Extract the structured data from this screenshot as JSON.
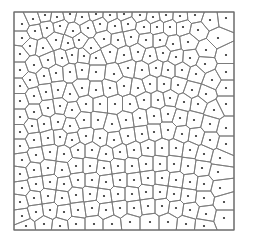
{
  "diagram": {
    "type": "voronoi",
    "frame": {
      "x": 14,
      "y": 12,
      "width": 220,
      "height": 218
    },
    "colors": {
      "background": "#ffffff",
      "edge": "#7a7a7a",
      "site": "#2b2b2b",
      "frame": "#6e6e6e"
    },
    "sites": [
      [
        22,
        24
      ],
      [
        33,
        19
      ],
      [
        45,
        15
      ],
      [
        57,
        17
      ],
      [
        70,
        14
      ],
      [
        82,
        17
      ],
      [
        96,
        14
      ],
      [
        110,
        15
      ],
      [
        124,
        14
      ],
      [
        140,
        15
      ],
      [
        153,
        17
      ],
      [
        166,
        15
      ],
      [
        180,
        16
      ],
      [
        195,
        15
      ],
      [
        210,
        20
      ],
      [
        226,
        18
      ],
      [
        22,
        38
      ],
      [
        35,
        31
      ],
      [
        47,
        28
      ],
      [
        60,
        26
      ],
      [
        73,
        31
      ],
      [
        88,
        28
      ],
      [
        100,
        24
      ],
      [
        115,
        26
      ],
      [
        128,
        24
      ],
      [
        144,
        27
      ],
      [
        157,
        27
      ],
      [
        170,
        27
      ],
      [
        183,
        27
      ],
      [
        198,
        30
      ],
      [
        218,
        38
      ],
      [
        20,
        54
      ],
      [
        30,
        46
      ],
      [
        43,
        48
      ],
      [
        56,
        40
      ],
      [
        68,
        43
      ],
      [
        79,
        40
      ],
      [
        91,
        48
      ],
      [
        104,
        39
      ],
      [
        118,
        40
      ],
      [
        131,
        37
      ],
      [
        146,
        40
      ],
      [
        160,
        40
      ],
      [
        173,
        44
      ],
      [
        188,
        42
      ],
      [
        206,
        50
      ],
      [
        226,
        55
      ],
      [
        20,
        70
      ],
      [
        34,
        65
      ],
      [
        48,
        60
      ],
      [
        62,
        58
      ],
      [
        72,
        55
      ],
      [
        84,
        56
      ],
      [
        96,
        58
      ],
      [
        110,
        52
      ],
      [
        124,
        55
      ],
      [
        138,
        52
      ],
      [
        150,
        56
      ],
      [
        163,
        53
      ],
      [
        176,
        57
      ],
      [
        190,
        58
      ],
      [
        205,
        64
      ],
      [
        226,
        72
      ],
      [
        20,
        86
      ],
      [
        30,
        80
      ],
      [
        44,
        76
      ],
      [
        56,
        73
      ],
      [
        70,
        72
      ],
      [
        82,
        70
      ],
      [
        96,
        72
      ],
      [
        114,
        74
      ],
      [
        128,
        68
      ],
      [
        142,
        70
      ],
      [
        156,
        68
      ],
      [
        168,
        70
      ],
      [
        182,
        70
      ],
      [
        196,
        74
      ],
      [
        212,
        80
      ],
      [
        226,
        88
      ],
      [
        20,
        101
      ],
      [
        34,
        96
      ],
      [
        46,
        92
      ],
      [
        58,
        90
      ],
      [
        70,
        94
      ],
      [
        82,
        88
      ],
      [
        96,
        90
      ],
      [
        110,
        88
      ],
      [
        124,
        86
      ],
      [
        138,
        88
      ],
      [
        150,
        84
      ],
      [
        164,
        84
      ],
      [
        178,
        85
      ],
      [
        192,
        90
      ],
      [
        206,
        94
      ],
      [
        226,
        104
      ],
      [
        20,
        117
      ],
      [
        34,
        112
      ],
      [
        48,
        108
      ],
      [
        60,
        106
      ],
      [
        72,
        110
      ],
      [
        86,
        104
      ],
      [
        100,
        104
      ],
      [
        115,
        104
      ],
      [
        130,
        104
      ],
      [
        144,
        100
      ],
      [
        158,
        100
      ],
      [
        170,
        98
      ],
      [
        184,
        102
      ],
      [
        198,
        104
      ],
      [
        214,
        110
      ],
      [
        20,
        132
      ],
      [
        32,
        126
      ],
      [
        44,
        124
      ],
      [
        58,
        122
      ],
      [
        70,
        126
      ],
      [
        84,
        120
      ],
      [
        98,
        120
      ],
      [
        112,
        124
      ],
      [
        126,
        120
      ],
      [
        140,
        118
      ],
      [
        154,
        116
      ],
      [
        168,
        114
      ],
      [
        180,
        118
      ],
      [
        194,
        120
      ],
      [
        210,
        124
      ],
      [
        226,
        128
      ],
      [
        20,
        146
      ],
      [
        34,
        140
      ],
      [
        48,
        138
      ],
      [
        60,
        137
      ],
      [
        72,
        140
      ],
      [
        86,
        136
      ],
      [
        100,
        138
      ],
      [
        114,
        140
      ],
      [
        128,
        136
      ],
      [
        142,
        134
      ],
      [
        154,
        132
      ],
      [
        168,
        130
      ],
      [
        182,
        134
      ],
      [
        196,
        136
      ],
      [
        210,
        140
      ],
      [
        226,
        144
      ],
      [
        22,
        160
      ],
      [
        36,
        155
      ],
      [
        50,
        152
      ],
      [
        64,
        154
      ],
      [
        78,
        150
      ],
      [
        92,
        150
      ],
      [
        106,
        154
      ],
      [
        120,
        152
      ],
      [
        134,
        150
      ],
      [
        148,
        148
      ],
      [
        162,
        148
      ],
      [
        176,
        148
      ],
      [
        190,
        150
      ],
      [
        204,
        154
      ],
      [
        220,
        158
      ],
      [
        20,
        174
      ],
      [
        34,
        170
      ],
      [
        48,
        168
      ],
      [
        62,
        170
      ],
      [
        76,
        166
      ],
      [
        90,
        166
      ],
      [
        104,
        168
      ],
      [
        118,
        166
      ],
      [
        132,
        166
      ],
      [
        146,
        164
      ],
      [
        160,
        164
      ],
      [
        174,
        164
      ],
      [
        188,
        166
      ],
      [
        202,
        168
      ],
      [
        218,
        172
      ],
      [
        22,
        188
      ],
      [
        36,
        184
      ],
      [
        50,
        182
      ],
      [
        64,
        184
      ],
      [
        78,
        180
      ],
      [
        92,
        180
      ],
      [
        106,
        182
      ],
      [
        120,
        180
      ],
      [
        134,
        180
      ],
      [
        148,
        178
      ],
      [
        162,
        178
      ],
      [
        176,
        180
      ],
      [
        190,
        182
      ],
      [
        204,
        184
      ],
      [
        220,
        188
      ],
      [
        20,
        202
      ],
      [
        34,
        198
      ],
      [
        48,
        196
      ],
      [
        62,
        198
      ],
      [
        76,
        195
      ],
      [
        90,
        194
      ],
      [
        104,
        196
      ],
      [
        118,
        194
      ],
      [
        132,
        194
      ],
      [
        146,
        192
      ],
      [
        160,
        192
      ],
      [
        174,
        194
      ],
      [
        188,
        196
      ],
      [
        204,
        198
      ],
      [
        224,
        202
      ],
      [
        22,
        216
      ],
      [
        36,
        212
      ],
      [
        50,
        210
      ],
      [
        64,
        212
      ],
      [
        78,
        210
      ],
      [
        92,
        208
      ],
      [
        106,
        210
      ],
      [
        120,
        208
      ],
      [
        134,
        208
      ],
      [
        148,
        206
      ],
      [
        162,
        206
      ],
      [
        176,
        208
      ],
      [
        190,
        210
      ],
      [
        206,
        214
      ],
      [
        224,
        218
      ],
      [
        26,
        226
      ],
      [
        44,
        224
      ],
      [
        60,
        226
      ],
      [
        76,
        224
      ],
      [
        94,
        224
      ],
      [
        112,
        224
      ],
      [
        130,
        222
      ],
      [
        150,
        222
      ],
      [
        168,
        222
      ],
      [
        186,
        224
      ],
      [
        204,
        226
      ]
    ]
  }
}
